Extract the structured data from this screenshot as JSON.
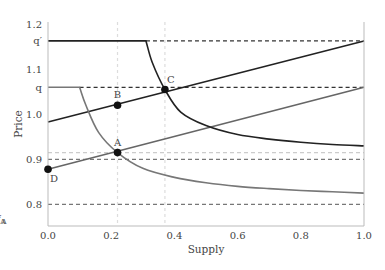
{
  "chart_data": {
    "type": "line",
    "title": "",
    "xlabel": "Supply",
    "ylabel": "Price",
    "xlim": [
      0.0,
      1.0
    ],
    "ylim": [
      0.752,
      1.205
    ],
    "grid": false,
    "legend": "none",
    "xticks": [
      {
        "value": 0.0,
        "label": "0.0"
      },
      {
        "value": 0.2,
        "label": "0.2"
      },
      {
        "value": 0.4,
        "label": "0.4"
      },
      {
        "value": 0.6,
        "label": "0.6"
      },
      {
        "value": 0.8,
        "label": "0.8"
      },
      {
        "value": 1.0,
        "label": "1.0"
      }
    ],
    "yticks": [
      {
        "value": 1.2,
        "label": "1.2"
      },
      {
        "value": 1.163,
        "label": "q′"
      },
      {
        "value": 1.1,
        "label": "1.1"
      },
      {
        "value": 1.06,
        "label": "q"
      },
      {
        "value": 1.0,
        "label": "1.0"
      },
      {
        "value": 0.9,
        "label": "0.9"
      },
      {
        "value": 0.8,
        "label": "0.8"
      }
    ],
    "x_annotations": [
      {
        "value": 0.22,
        "label": "y",
        "sub": "A",
        "prime": false
      },
      {
        "value": 0.37,
        "label": "y",
        "sub": "A",
        "prime": true
      }
    ],
    "hlines": [
      {
        "name": "q-prime-level",
        "y": 1.163,
        "x_from": 0.31,
        "color": "#333333",
        "style": "dashed"
      },
      {
        "name": "q-level",
        "y": 1.06,
        "x_from": 0.1,
        "color": "#333333",
        "style": "dashed"
      },
      {
        "name": "level-A",
        "y": 0.915,
        "x_from": 0.0,
        "color": "#cccccc",
        "style": "dashed"
      },
      {
        "name": "level-0.9",
        "y": 0.9,
        "x_from": 0.0,
        "color": "#777777",
        "style": "dashed"
      },
      {
        "name": "level-0.8",
        "y": 0.8,
        "x_from": 0.0,
        "color": "#777777",
        "style": "dashed"
      }
    ],
    "vlines": [
      {
        "name": "vline-yA",
        "x": 0.22,
        "color": "#dddddd"
      },
      {
        "name": "vline-yA-prime",
        "x": 0.37,
        "color": "#dddddd"
      }
    ],
    "series": [
      {
        "name": "upper-supply-line",
        "color": "#222222",
        "points": [
          [
            0.0,
            0.983
          ],
          [
            1.0,
            1.163
          ]
        ]
      },
      {
        "name": "lower-supply-line",
        "color": "#666666",
        "points": [
          [
            0.0,
            0.878
          ],
          [
            1.0,
            1.06
          ]
        ]
      },
      {
        "name": "upper-demand-curve",
        "color": "#222222",
        "points": [
          [
            0.0,
            1.163
          ],
          [
            0.31,
            1.163
          ],
          [
            0.33,
            1.115
          ],
          [
            0.37,
            1.055
          ],
          [
            0.42,
            1.005
          ],
          [
            0.5,
            0.975
          ],
          [
            0.6,
            0.955
          ],
          [
            0.7,
            0.945
          ],
          [
            0.8,
            0.938
          ],
          [
            0.9,
            0.933
          ],
          [
            1.0,
            0.93
          ]
        ]
      },
      {
        "name": "lower-demand-curve",
        "color": "#777777",
        "points": [
          [
            0.0,
            1.06
          ],
          [
            0.1,
            1.06
          ],
          [
            0.12,
            1.02
          ],
          [
            0.16,
            0.96
          ],
          [
            0.22,
            0.915
          ],
          [
            0.3,
            0.88
          ],
          [
            0.4,
            0.86
          ],
          [
            0.5,
            0.848
          ],
          [
            0.6,
            0.84
          ],
          [
            0.7,
            0.835
          ],
          [
            0.8,
            0.831
          ],
          [
            0.9,
            0.828
          ],
          [
            1.0,
            0.825
          ]
        ]
      }
    ],
    "points": [
      {
        "label": "A",
        "x": 0.22,
        "y": 0.915,
        "label_pos": "above"
      },
      {
        "label": "B",
        "x": 0.22,
        "y": 1.02,
        "label_pos": "above"
      },
      {
        "label": "C",
        "x": 0.37,
        "y": 1.055,
        "label_pos": "above-right"
      },
      {
        "label": "D",
        "x": 0.0,
        "y": 0.878,
        "label_pos": "below-right"
      }
    ]
  }
}
